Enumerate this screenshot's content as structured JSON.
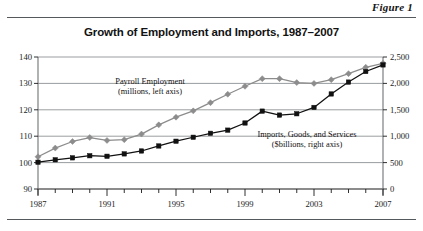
{
  "figure": {
    "label": "Figure 1",
    "title": "Growth of Employment and Imports, 1987–2007"
  },
  "chart_data": {
    "type": "line",
    "title": "Growth of Employment and Imports, 1987–2007",
    "xlabel": "",
    "ylabel": "",
    "grid": true,
    "legend_position": "inline-annotation",
    "x": [
      1987,
      1988,
      1989,
      1990,
      1991,
      1992,
      1993,
      1994,
      1995,
      1996,
      1997,
      1998,
      1999,
      2000,
      2001,
      2002,
      2003,
      2004,
      2005,
      2006,
      2007
    ],
    "xlim": [
      1987,
      2007
    ],
    "xticks": [
      1987,
      1991,
      1995,
      1999,
      2003,
      2007
    ],
    "xtick_labels": [
      "1987",
      "1991",
      "1995",
      "1999",
      "2003",
      "2007"
    ],
    "axes": [
      {
        "name": "left",
        "label": "Payroll Employment (millions, left axis)",
        "ylim": [
          90,
          140
        ],
        "yticks": [
          90,
          100,
          110,
          120,
          130,
          140
        ],
        "ytick_labels": [
          "90",
          "100",
          "110",
          "120",
          "130",
          "140"
        ]
      },
      {
        "name": "right",
        "label": "Imports, Goods, and Services ($billions, right axis)",
        "ylim": [
          0,
          2500
        ],
        "yticks": [
          0,
          500,
          1000,
          1500,
          2000,
          2500
        ],
        "ytick_labels": [
          "0",
          "500",
          "1,000",
          "1,500",
          "2,000",
          "2,500"
        ]
      }
    ],
    "series": [
      {
        "name": "Payroll Employment",
        "axis": "left",
        "unit": "millions",
        "color": "#8c8c8c",
        "marker": "diamond",
        "values": [
          102.2,
          105.5,
          108.0,
          109.5,
          108.4,
          108.7,
          110.8,
          114.3,
          117.2,
          119.6,
          122.7,
          125.9,
          128.9,
          131.8,
          131.8,
          130.3,
          130.0,
          131.4,
          133.7,
          136.1,
          137.6
        ]
      },
      {
        "name": "Imports, Goods, and Services",
        "axis": "right",
        "unit": "$billions",
        "color": "#111111",
        "marker": "square",
        "values": [
          507,
          553,
          590,
          630,
          620,
          665,
          720,
          815,
          905,
          980,
          1055,
          1115,
          1250,
          1475,
          1400,
          1425,
          1545,
          1800,
          2025,
          2225,
          2350
        ]
      }
    ],
    "annotations": [
      {
        "id": "employment-annotation",
        "line1": "Payroll Employment",
        "line2": "(millions, left axis)"
      },
      {
        "id": "imports-annotation",
        "line1": "Imports, Goods, and Services",
        "line2": "($billions, right axis)"
      }
    ]
  }
}
